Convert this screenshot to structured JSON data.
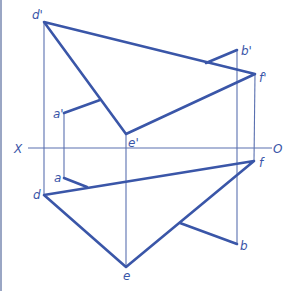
{
  "diagram": {
    "type": "orthographic-projection",
    "axis": {
      "left_label": "X",
      "right_label": "O"
    },
    "points": {
      "d_prime": "d'",
      "e_prime": "e'",
      "f_prime": "f'",
      "a_prime": "a'",
      "b_prime": "b'",
      "d": "d",
      "e": "e",
      "f": "f",
      "a": "a",
      "b": "b"
    },
    "colors": {
      "line": "#3a56a8",
      "thin_line": "#5a70b0",
      "border": "#9aa6c4"
    }
  }
}
